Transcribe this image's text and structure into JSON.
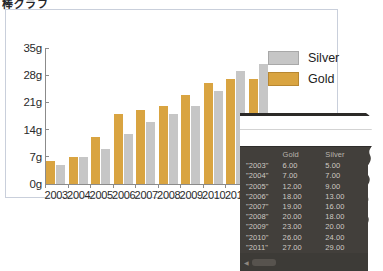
{
  "page": {
    "title": "棒グラフ"
  },
  "legend": {
    "position": "top-right",
    "items": [
      {
        "label": "Silver",
        "color": "#c6c6c6"
      },
      {
        "label": "Gold",
        "color": "#d9a441"
      }
    ]
  },
  "table": {
    "columns": [
      "",
      "Gold",
      "Silver"
    ],
    "rows": [
      {
        "year": "\"2003\"",
        "gold": "6.00",
        "silver": "5.00"
      },
      {
        "year": "\"2004\"",
        "gold": "7.00",
        "silver": "7.00"
      },
      {
        "year": "\"2005\"",
        "gold": "12.00",
        "silver": "9.00"
      },
      {
        "year": "\"2006\"",
        "gold": "18.00",
        "silver": "13.00"
      },
      {
        "year": "\"2007\"",
        "gold": "19.00",
        "silver": "16.00"
      },
      {
        "year": "\"2008\"",
        "gold": "20.00",
        "silver": "18.00"
      },
      {
        "year": "\"2009\"",
        "gold": "23.00",
        "silver": "20.00"
      },
      {
        "year": "\"2010\"",
        "gold": "26.00",
        "silver": "24.00"
      },
      {
        "year": "\"2011\"",
        "gold": "27.00",
        "silver": "29.00"
      },
      {
        "year": "\"2012\"",
        "gold": "27.00",
        "silver": "31.00"
      }
    ]
  },
  "chart_data": {
    "type": "bar",
    "title": "",
    "xlabel": "",
    "ylabel": "",
    "categories": [
      "2003",
      "2004",
      "2005",
      "2006",
      "2007",
      "2008",
      "2009",
      "2010",
      "2011",
      "2012"
    ],
    "series": [
      {
        "name": "Gold",
        "color": "#d9a441",
        "values": [
          6,
          7,
          12,
          18,
          19,
          20,
          23,
          26,
          27,
          27
        ]
      },
      {
        "name": "Silver",
        "color": "#c6c6c6",
        "values": [
          5,
          7,
          9,
          13,
          16,
          18,
          20,
          24,
          29,
          31
        ]
      }
    ],
    "ylim": [
      0,
      35
    ],
    "yticks": [
      0,
      7,
      14,
      21,
      28,
      35
    ],
    "ytick_labels": [
      "0g",
      "7g",
      "14g",
      "21g",
      "28g",
      "35g"
    ],
    "grid": false,
    "legend_position": "top-right"
  }
}
